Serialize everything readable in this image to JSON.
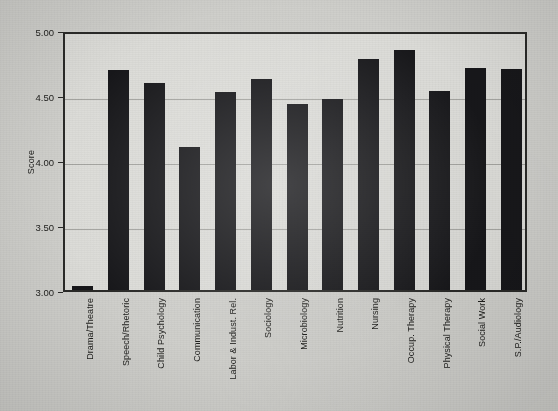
{
  "chart_data": {
    "type": "bar",
    "title": "",
    "subtitle": "",
    "xlabel": "",
    "ylabel": "Score",
    "ylim": [
      3.0,
      5.0
    ],
    "ytick_labels": [
      "5.00",
      "4.50",
      "4.00",
      "3.50",
      "3.00"
    ],
    "ytick_values": [
      5.0,
      4.5,
      4.0,
      3.5,
      3.0
    ],
    "grid": "horizontal",
    "legend": "none",
    "bar_color": "#17171a",
    "categories": [
      "Drama/Theatre",
      "Speech/Rhetoric",
      "Child Psychology",
      "Communication",
      "Labor & Indust. Rel.",
      "Sociology",
      "Microbiology",
      "Nutrition",
      "Nursing",
      "Occup. Therapy",
      "Physical Therapy",
      "Social Work",
      "S.P./Audiology"
    ],
    "values": [
      3.03,
      4.69,
      4.59,
      4.1,
      4.52,
      4.62,
      4.43,
      4.47,
      4.78,
      4.85,
      4.53,
      4.71,
      4.7
    ]
  }
}
